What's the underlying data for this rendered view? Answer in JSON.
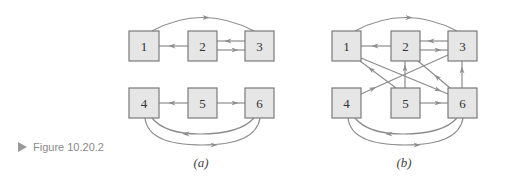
{
  "figure": {
    "label": "Figure 10.20.2",
    "arrow_icon": "triangle-right-icon"
  },
  "diagrams": [
    {
      "id": "a",
      "caption": "(a)",
      "nodes": [
        "1",
        "2",
        "3",
        "4",
        "5",
        "6"
      ],
      "edges": [
        [
          "1",
          "3"
        ],
        [
          "2",
          "1"
        ],
        [
          "3",
          "2"
        ],
        [
          "2",
          "3"
        ],
        [
          "5",
          "4"
        ],
        [
          "5",
          "6"
        ],
        [
          "6",
          "4"
        ],
        [
          "4",
          "6"
        ]
      ]
    },
    {
      "id": "b",
      "caption": "(b)",
      "nodes": [
        "1",
        "2",
        "3",
        "4",
        "5",
        "6"
      ],
      "edges": [
        [
          "1",
          "3"
        ],
        [
          "2",
          "1"
        ],
        [
          "3",
          "2"
        ],
        [
          "2",
          "3"
        ],
        [
          "1",
          "6"
        ],
        [
          "5",
          "1"
        ],
        [
          "5",
          "2"
        ],
        [
          "4",
          "3"
        ],
        [
          "6",
          "2"
        ],
        [
          "6",
          "3"
        ],
        [
          "5",
          "6"
        ],
        [
          "6",
          "4"
        ],
        [
          "4",
          "6"
        ]
      ]
    }
  ],
  "colors": {
    "node_fill": "#e6e6e6",
    "node_stroke": "#7a7a7a",
    "edge": "#8c8c8c"
  }
}
